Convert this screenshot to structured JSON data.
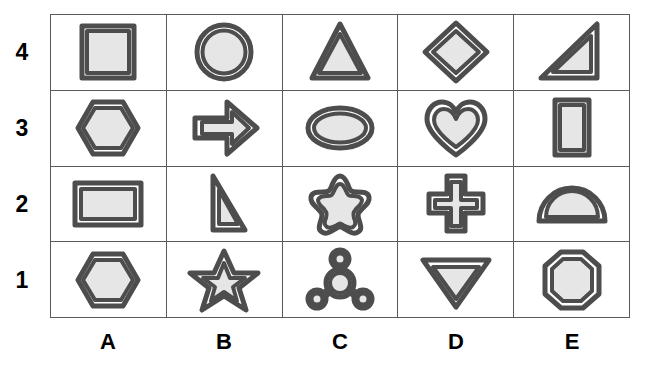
{
  "figure": {
    "kind": "shape-grid",
    "columns": 5,
    "rows": 4,
    "fill_color": "#e6e6e6",
    "stroke_color": "#4d4d4d",
    "grid_line_color": "#5a5a5a",
    "background_color": "#ffffff"
  },
  "column_labels": [
    "A",
    "B",
    "C",
    "D",
    "E"
  ],
  "row_labels": [
    "4",
    "3",
    "2",
    "1"
  ],
  "cells": [
    {
      "ref": "A4",
      "column": "A",
      "row": "4",
      "shape": "square",
      "outline": "double"
    },
    {
      "ref": "B4",
      "column": "B",
      "row": "4",
      "shape": "circle",
      "outline": "double"
    },
    {
      "ref": "C4",
      "column": "C",
      "row": "4",
      "shape": "triangle",
      "outline": "double"
    },
    {
      "ref": "D4",
      "column": "D",
      "row": "4",
      "shape": "diamond",
      "outline": "double"
    },
    {
      "ref": "E4",
      "column": "E",
      "row": "4",
      "shape": "right-triangle",
      "outline": "double"
    },
    {
      "ref": "A3",
      "column": "A",
      "row": "3",
      "shape": "hexagon",
      "outline": "double"
    },
    {
      "ref": "B3",
      "column": "B",
      "row": "3",
      "shape": "right-arrow",
      "outline": "double"
    },
    {
      "ref": "C3",
      "column": "C",
      "row": "3",
      "shape": "ellipse",
      "outline": "double"
    },
    {
      "ref": "D3",
      "column": "D",
      "row": "3",
      "shape": "heart",
      "outline": "double"
    },
    {
      "ref": "E3",
      "column": "E",
      "row": "3",
      "shape": "rectangle-vertical",
      "outline": "double"
    },
    {
      "ref": "A2",
      "column": "A",
      "row": "2",
      "shape": "rectangle-horizontal",
      "outline": "double"
    },
    {
      "ref": "B2",
      "column": "B",
      "row": "2",
      "shape": "right-triangle-narrow",
      "outline": "double"
    },
    {
      "ref": "C2",
      "column": "C",
      "row": "2",
      "shape": "rounded-star",
      "outline": "double"
    },
    {
      "ref": "D2",
      "column": "D",
      "row": "2",
      "shape": "cross",
      "outline": "double"
    },
    {
      "ref": "E2",
      "column": "E",
      "row": "2",
      "shape": "semicircle",
      "outline": "double"
    },
    {
      "ref": "A1",
      "column": "A",
      "row": "1",
      "shape": "hexagon",
      "outline": "double"
    },
    {
      "ref": "B1",
      "column": "B",
      "row": "1",
      "shape": "star",
      "outline": "double"
    },
    {
      "ref": "C1",
      "column": "C",
      "row": "1",
      "shape": "molecule",
      "outline": "double"
    },
    {
      "ref": "D1",
      "column": "D",
      "row": "1",
      "shape": "inverted-triangle",
      "outline": "double"
    },
    {
      "ref": "E1",
      "column": "E",
      "row": "1",
      "shape": "octagon",
      "outline": "double"
    }
  ]
}
